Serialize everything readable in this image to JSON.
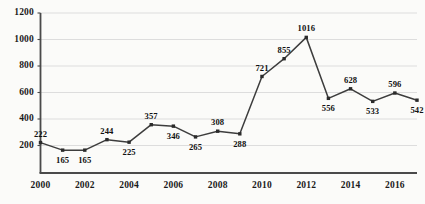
{
  "chart_data": {
    "type": "line",
    "title": "",
    "xlabel": "",
    "ylabel": "",
    "x": [
      2000,
      2001,
      2002,
      2003,
      2004,
      2005,
      2006,
      2007,
      2008,
      2009,
      2010,
      2011,
      2012,
      2013,
      2014,
      2015,
      2016,
      2017
    ],
    "values": [
      222,
      165,
      165,
      244,
      225,
      357,
      346,
      265,
      308,
      288,
      721,
      855,
      1016,
      556,
      628,
      533,
      596,
      542
    ],
    "point_labels": [
      "222",
      "165",
      "165",
      "244",
      "225",
      "357",
      "346",
      "265",
      "308",
      "288",
      "721",
      "855",
      "1016",
      "556",
      "628",
      "533",
      "596",
      "542"
    ],
    "label_positions": [
      "above",
      "below",
      "below",
      "above",
      "below",
      "above",
      "below",
      "below",
      "above",
      "below",
      "above",
      "above",
      "above",
      "below",
      "above",
      "below",
      "above",
      "below"
    ],
    "xlim": [
      2000,
      2017
    ],
    "ylim": [
      0,
      1200
    ],
    "ytick_labels": [
      "200",
      "400",
      "600",
      "800",
      "1000",
      "1200"
    ],
    "ytick_values": [
      200,
      400,
      600,
      800,
      1000,
      1200
    ],
    "xtick_labels": [
      "2000",
      "2002",
      "2004",
      "2006",
      "2008",
      "2010",
      "2012",
      "2014",
      "2016"
    ],
    "xtick_values": [
      2000,
      2002,
      2004,
      2006,
      2008,
      2010,
      2012,
      2014,
      2016
    ],
    "grid": true,
    "legend": false,
    "line_color": "#3d3d3d",
    "marker_color": "#2b2b2b",
    "marker": "square",
    "grid_color": "#d9d9d9",
    "axis_color": "#4a4a4a",
    "background": "#fbfbf9"
  }
}
